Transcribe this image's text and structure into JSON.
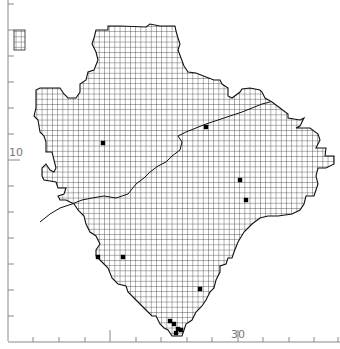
{
  "map": {
    "type": "grid distribution map",
    "grid_cell_px": 5.2,
    "ticks_every_cells": 5,
    "colors": {
      "grid": "#222222",
      "outline": "#111111",
      "axis": "#888888",
      "record_dot": "#000000",
      "background": "#ffffff"
    },
    "axis_labels": {
      "left": "10",
      "bottom": "30"
    },
    "records": [
      {
        "x": 103,
        "y": 143
      },
      {
        "x": 206,
        "y": 127
      },
      {
        "x": 240,
        "y": 180
      },
      {
        "x": 246,
        "y": 200
      },
      {
        "x": 98,
        "y": 257
      },
      {
        "x": 123,
        "y": 257
      },
      {
        "x": 200,
        "y": 289
      },
      {
        "x": 170,
        "y": 321
      },
      {
        "x": 174,
        "y": 324
      },
      {
        "x": 178,
        "y": 329
      },
      {
        "x": 181,
        "y": 330
      },
      {
        "x": 176,
        "y": 333
      }
    ],
    "inset": {
      "label": "offshore island grid",
      "x": 13,
      "y": 30,
      "w": 12,
      "h": 20
    }
  }
}
